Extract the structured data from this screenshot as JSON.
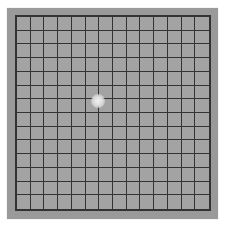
{
  "figure": {
    "type": "amsler-grid",
    "rows": 14,
    "columns": 14,
    "colors": {
      "background": "#ffffff",
      "panel": "#9a9a9a",
      "cell_fill": "#a3a3a3",
      "grid_lines": "#333333",
      "fixation_dot": "#f2f2f2"
    },
    "fixation_dot": {
      "center_x": 98,
      "center_y": 101,
      "radius": 7
    }
  }
}
